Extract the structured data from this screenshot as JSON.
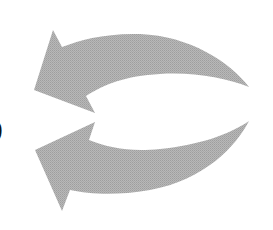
{
  "figure": {
    "type": "diagram",
    "clipped_text": ")",
    "arrow_color": "#b2b2b2",
    "arrows": [
      {
        "name": "upper-arrow",
        "direction": "left",
        "curve": "arcs-upward"
      },
      {
        "name": "lower-arrow",
        "direction": "left",
        "curve": "arcs-downward"
      }
    ]
  }
}
